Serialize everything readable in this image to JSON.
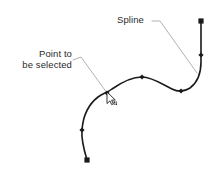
{
  "figure": {
    "type": "technical-illustration",
    "background_color": "#ffffff",
    "curve_color": "#1a1a1a",
    "leader_color": "#a8a8a8",
    "text_color": "#2b2b2b",
    "marker_color": "#1a1a1a"
  },
  "labels": {
    "spline": "Spline",
    "point_line1": "Point to",
    "point_line2": "be selected"
  },
  "annotations": {
    "spline_leader": {
      "name": "spline-leader-line",
      "stub_from": [
        152,
        21
      ],
      "stub_to": [
        160,
        21
      ],
      "line_to": [
        197,
        73
      ]
    },
    "point_leader": {
      "name": "point-leader-line",
      "stub_from": [
        73,
        60
      ],
      "stub_to": [
        81,
        57
      ],
      "line_to": [
        107,
        93
      ]
    }
  },
  "cursor": {
    "name": "mouse-pointer",
    "x": 107,
    "y": 92,
    "style": "arrow-with-label"
  },
  "chart_data": {
    "type": "line",
    "xlabel": "",
    "ylabel": "",
    "xlim": [
      0,
      224
    ],
    "ylim": [
      0,
      174
    ],
    "grid": false,
    "legend": "none",
    "series": [
      {
        "name": "spline",
        "path": "M 87,160 C 84,150 81,140 82,130 C 83,116 89,104 98,97 C 103,93 107,93 112,89 C 122,82 132,77 142,77 C 152,77 162,84 172,89 C 178,92 184,92 190,88 C 198,82 201,73 201,62 C 201,48 201,34 201,22",
        "stroke": "#1a1a1a",
        "stroke_width": 1.6
      }
    ],
    "endpoints": [
      {
        "name": "start-endpoint",
        "x": 87,
        "y": 160,
        "marker": "square"
      },
      {
        "name": "end-endpoint",
        "x": 201,
        "y": 21,
        "marker": "square"
      }
    ],
    "control_points": [
      {
        "name": "control-point-1",
        "x": 82,
        "y": 130,
        "marker": "diamond"
      },
      {
        "name": "control-point-selected",
        "x": 107,
        "y": 93,
        "marker": "diamond"
      },
      {
        "name": "control-point-3",
        "x": 142,
        "y": 77,
        "marker": "diamond"
      },
      {
        "name": "control-point-4",
        "x": 181,
        "y": 91,
        "marker": "diamond"
      },
      {
        "name": "control-point-5",
        "x": 201,
        "y": 55,
        "marker": "diamond"
      }
    ]
  }
}
